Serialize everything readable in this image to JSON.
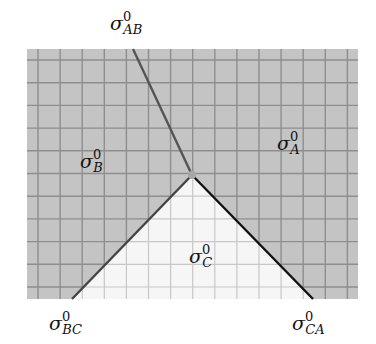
{
  "diagram": {
    "grid": {
      "x0": 27,
      "y0": 49,
      "x1": 358,
      "y1": 299,
      "spacing_x": 22.1,
      "spacing_y": 22.7,
      "offset_x": 11,
      "offset_y": 11,
      "dark_fill": "#c4c4c4",
      "light_fill": "#f6f6f6",
      "line_color_dark": "#8e8e8e",
      "line_color_light": "#c8c8c8"
    },
    "junction": {
      "x": 192,
      "y": 175
    },
    "edges": [
      {
        "name": "AB",
        "from": [
          133,
          49
        ],
        "to": [
          192,
          175
        ],
        "color": "#555555"
      },
      {
        "name": "BC",
        "from": [
          72,
          299
        ],
        "to": [
          192,
          175
        ],
        "color": "#444444"
      },
      {
        "name": "CA",
        "from": [
          313,
          299
        ],
        "to": [
          192,
          175
        ],
        "color": "#111111"
      }
    ],
    "labels": {
      "sigma_AB": {
        "base": "σ",
        "sup": "0",
        "sub": "AB",
        "x": 110,
        "y": 30
      },
      "sigma_B": {
        "base": "σ",
        "sup": "0",
        "sub": "B",
        "x": 80,
        "y": 168
      },
      "sigma_A": {
        "base": "σ",
        "sup": "0",
        "sub": "A",
        "x": 277,
        "y": 150
      },
      "sigma_C": {
        "base": "σ",
        "sup": "0",
        "sub": "C",
        "x": 189,
        "y": 263
      },
      "sigma_BC": {
        "base": "σ",
        "sup": "0",
        "sub": "BC",
        "x": 49,
        "y": 330
      },
      "sigma_CA": {
        "base": "σ",
        "sup": "0",
        "sub": "CA",
        "x": 292,
        "y": 330
      }
    }
  }
}
